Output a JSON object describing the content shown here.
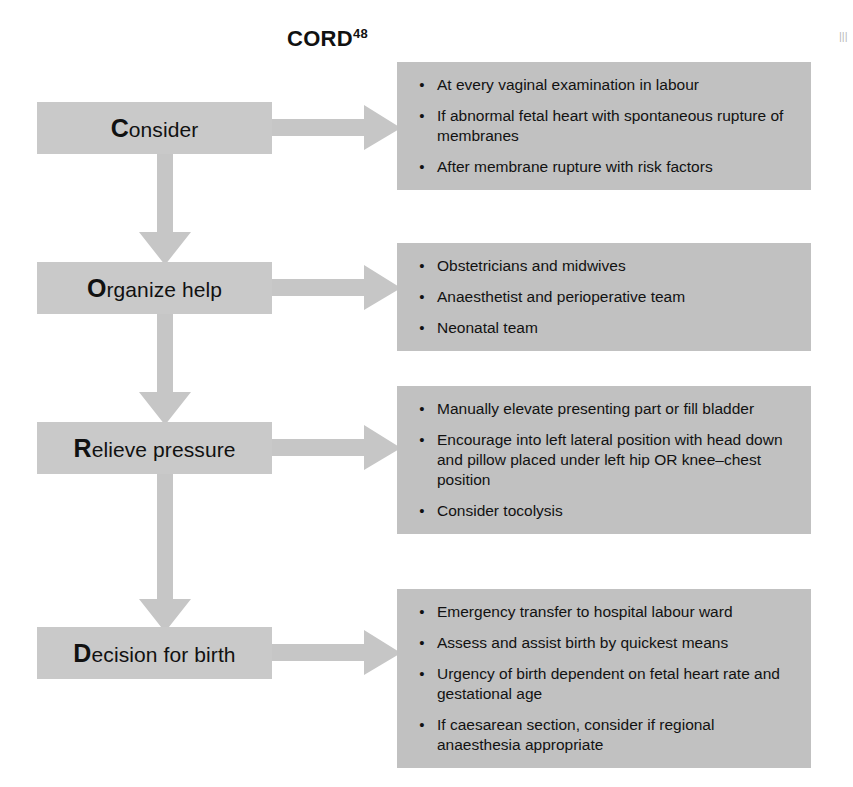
{
  "diagram": {
    "title_text": "CORD",
    "title_superscript": "48",
    "palette": {
      "step_box": "#c9c9c9",
      "content_box": "#c1c1c1",
      "arrow": "#c6c6c6",
      "text": "#121212",
      "background": "#ffffff"
    },
    "bullet_glyph": "•",
    "steps": [
      {
        "initial": "C",
        "rest": "onsider",
        "full_label": "Consider",
        "items": [
          "At every vaginal examination in labour",
          "If abnormal fetal heart with spontaneous rupture of membranes",
          "After membrane rupture with risk factors"
        ]
      },
      {
        "initial": "O",
        "rest": "rganize help",
        "full_label": "Organize help",
        "items": [
          "Obstetricians and midwives",
          "Anaesthetist and perioperative team",
          "Neonatal team"
        ]
      },
      {
        "initial": "R",
        "rest": "elieve pressure",
        "full_label": "Relieve pressure",
        "items": [
          "Manually elevate presenting part or fill bladder",
          "Encourage into left lateral position with head down and pillow placed under left hip OR knee–chest position",
          "Consider tocolysis"
        ]
      },
      {
        "initial": "D",
        "rest": "ecision for birth",
        "full_label": "Decision for birth",
        "items": [
          "Emergency transfer to hospital labour ward",
          "Assess and assist birth by quickest means",
          "Urgency of birth dependent on fetal heart rate and gestational age",
          "If caesarean section, consider if regional anaesthesia appropriate"
        ]
      }
    ],
    "caption_remnant": "|||"
  }
}
